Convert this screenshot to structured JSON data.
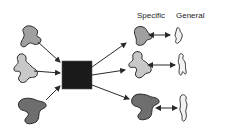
{
  "labels": {
    "specific": "Specific",
    "general": "General"
  },
  "colors": {
    "light_gray": "#c8c8c8",
    "mid_gray": "#a0a0a0",
    "dark_gray": "#6e6e6e",
    "black_box": "#1a1a1a",
    "outline": "#2a2a2a",
    "white_shape": "#f2f2f2"
  },
  "nodes": {
    "inputs": [
      {
        "id": "input-1",
        "shade": "mid_gray"
      },
      {
        "id": "input-2",
        "shade": "light_gray"
      },
      {
        "id": "input-3",
        "shade": "dark_gray"
      }
    ],
    "processor": {
      "id": "black-box"
    },
    "specific_outputs": [
      {
        "id": "specific-1",
        "shade": "mid_gray"
      },
      {
        "id": "specific-2",
        "shade": "light_gray"
      },
      {
        "id": "specific-3",
        "shade": "dark_gray"
      }
    ],
    "general_outputs": [
      {
        "id": "general-1"
      },
      {
        "id": "general-2"
      },
      {
        "id": "general-3"
      }
    ]
  }
}
